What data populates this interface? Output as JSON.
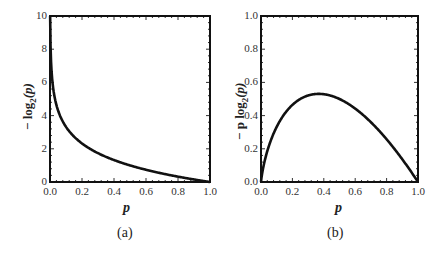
{
  "chart_data": [
    {
      "id": "a",
      "type": "line",
      "caption": "(a)",
      "title": "",
      "xlabel": "p",
      "ylabel_prefix": "− log",
      "ylabel_sub": "2",
      "ylabel_arg": "(p)",
      "xlim": [
        0,
        1
      ],
      "ylim": [
        0,
        10
      ],
      "xticks": [
        "0.0",
        "0.2",
        "0.4",
        "0.6",
        "0.8",
        "1.0"
      ],
      "yticks": [
        "0",
        "2",
        "4",
        "6",
        "8",
        "10"
      ],
      "grid": false,
      "series": [
        {
          "name": "-log2(p)",
          "function": "-log2(p)",
          "x": [
            0.001,
            0.005,
            0.01,
            0.02,
            0.03,
            0.05,
            0.075,
            0.1,
            0.15,
            0.2,
            0.25,
            0.3,
            0.4,
            0.5,
            0.6,
            0.7,
            0.8,
            0.9,
            1.0
          ],
          "values": [
            9.97,
            7.64,
            6.64,
            5.64,
            5.06,
            4.32,
            3.74,
            3.32,
            2.74,
            2.32,
            2.0,
            1.74,
            1.32,
            1.0,
            0.74,
            0.51,
            0.32,
            0.15,
            0.0
          ]
        }
      ]
    },
    {
      "id": "b",
      "type": "line",
      "caption": "(b)",
      "title": "",
      "xlabel": "p",
      "ylabel_prefix": "− p log",
      "ylabel_sub": "2",
      "ylabel_arg": "(p)",
      "xlim": [
        0,
        1
      ],
      "ylim": [
        0,
        1
      ],
      "xticks": [
        "0.0",
        "0.2",
        "0.4",
        "0.6",
        "0.8",
        "1.0"
      ],
      "yticks": [
        "0.0",
        "0.2",
        "0.4",
        "0.6",
        "0.8",
        "1.0"
      ],
      "grid": false,
      "series": [
        {
          "name": "-p log2(p)",
          "function": "-p*log2(p)",
          "x": [
            0.0,
            0.01,
            0.02,
            0.05,
            0.1,
            0.15,
            0.2,
            0.25,
            0.3,
            0.368,
            0.4,
            0.5,
            0.6,
            0.7,
            0.8,
            0.9,
            1.0
          ],
          "values": [
            0.0,
            0.066,
            0.113,
            0.216,
            0.332,
            0.411,
            0.464,
            0.5,
            0.521,
            0.531,
            0.529,
            0.5,
            0.442,
            0.36,
            0.258,
            0.137,
            0.0
          ]
        }
      ]
    }
  ]
}
